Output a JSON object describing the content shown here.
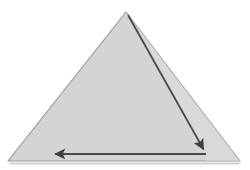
{
  "figure": {
    "name": "triangle-with-directed-path",
    "type": "geometry-diagram",
    "width": 250,
    "height": 170,
    "background_color": "#ffffff",
    "caption": "",
    "shapes": {
      "triangle": {
        "label": "",
        "fill_color": "#d4d4d4",
        "stroke_color": "#9a9a9a",
        "stroke_width": 1.2,
        "vertices": [
          {
            "name": "apex",
            "x": 126,
            "y": 12
          },
          {
            "name": "bottom-right",
            "x": 240,
            "y": 161
          },
          {
            "name": "bottom-left",
            "x": 8,
            "y": 161
          }
        ]
      }
    },
    "arrows": [
      {
        "name": "diagonal-arrow",
        "direction": "down-right",
        "color": "#4a4a4a",
        "stroke_width": 1.8,
        "start": {
          "x": 128,
          "y": 15
        },
        "end": {
          "x": 205,
          "y": 152
        },
        "head": "filled-triangle"
      },
      {
        "name": "horizontal-arrow",
        "direction": "left",
        "color": "#4a4a4a",
        "stroke_width": 1.8,
        "start": {
          "x": 206,
          "y": 154
        },
        "end": {
          "x": 52,
          "y": 154
        },
        "head": "filled-triangle"
      }
    ],
    "shadow": {
      "name": "base-shadow",
      "color": "#c9c9c9",
      "present": true
    }
  }
}
